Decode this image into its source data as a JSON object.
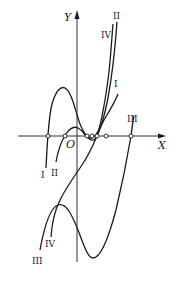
{
  "figure": {
    "axes": {
      "x_label": "X",
      "y_label": "Y",
      "origin_label": "O"
    },
    "curves": [
      {
        "id": "I",
        "label": "I"
      },
      {
        "id": "II",
        "label": "II"
      },
      {
        "id": "III",
        "label": "III"
      },
      {
        "id": "IV",
        "label": "IV"
      }
    ],
    "colors": {
      "stroke": "#1a1a1a",
      "background": "#ffffff"
    }
  }
}
